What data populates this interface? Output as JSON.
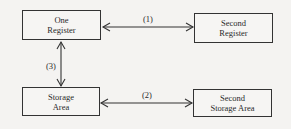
{
  "diagram": {
    "nodes": [
      {
        "id": "one-register",
        "label": "One\nRegister"
      },
      {
        "id": "second-register",
        "label": "Second\nRegister"
      },
      {
        "id": "storage-area",
        "label": "Storage\nArea"
      },
      {
        "id": "second-storage-area",
        "label": "Second\nStorage Area"
      }
    ],
    "edges": [
      {
        "from": "one-register",
        "to": "second-register",
        "label": "(1)",
        "direction": "bidirectional"
      },
      {
        "from": "storage-area",
        "to": "second-storage-area",
        "label": "(2)",
        "direction": "bidirectional"
      },
      {
        "from": "one-register",
        "to": "storage-area",
        "label": "(3)",
        "direction": "bidirectional"
      }
    ]
  }
}
